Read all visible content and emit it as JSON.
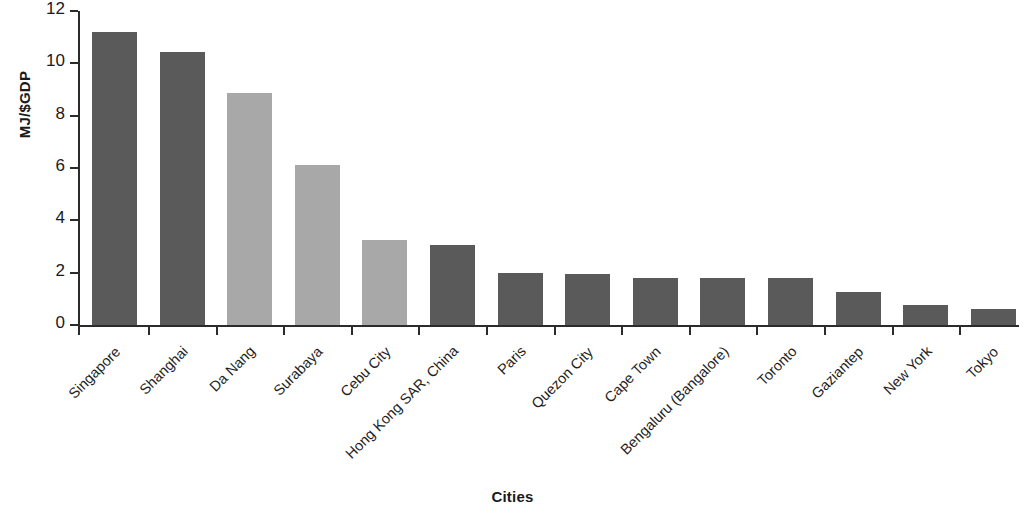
{
  "chart_data": {
    "type": "bar",
    "title": "",
    "xlabel": "Cities",
    "ylabel": "MJ/$GDP",
    "ylim": [
      0,
      12
    ],
    "yticks": [
      0,
      2,
      4,
      6,
      8,
      10,
      12
    ],
    "ytick_labels": [
      "0",
      "2",
      "4",
      "6",
      "8",
      "10",
      "12"
    ],
    "grid": false,
    "legend": "none",
    "categories": [
      "Singapore",
      "Shanghai",
      "Da Nang",
      "Surabaya",
      "Cebu City",
      "Hong Kong SAR, China",
      "Paris",
      "Quezon City",
      "Cape Town",
      "Bengaluru (Bangalore)",
      "Toronto",
      "Gaziantep",
      "New York",
      "Tokyo"
    ],
    "values": [
      11.2,
      10.45,
      8.85,
      6.1,
      3.25,
      3.05,
      2.0,
      1.95,
      1.8,
      1.8,
      1.8,
      1.25,
      0.75,
      0.6
    ],
    "bar_colors": [
      "#5a5a5a",
      "#5a5a5a",
      "#a8a8a8",
      "#a8a8a8",
      "#a8a8a8",
      "#5a5a5a",
      "#5a5a5a",
      "#5a5a5a",
      "#5a5a5a",
      "#5a5a5a",
      "#5a5a5a",
      "#5a5a5a",
      "#5a5a5a",
      "#5a5a5a"
    ],
    "axis_color": "#2b2b2b",
    "background": "#ffffff"
  }
}
